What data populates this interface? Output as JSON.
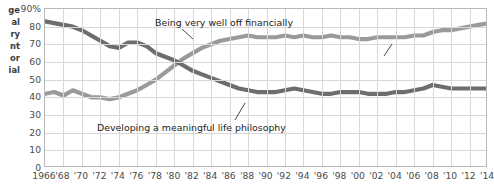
{
  "axis_caption": {
    "text": "ge\nal\nry\nnt\nor\nial",
    "full_lines": [
      "ge",
      "al",
      "ry",
      "nt",
      "or",
      "ial"
    ]
  },
  "colors": {
    "financial_line": "#9a9a9a",
    "philosophy_line": "#6d6d6d",
    "grid": "#d8d8d8",
    "frame": "#b9b9b9",
    "text": "#4a4a4a"
  },
  "annotations": {
    "financial": "Being very well off financially",
    "philosophy": "Developing a meaningful life philosophy"
  },
  "chart_data": {
    "type": "line",
    "title": "",
    "xlabel": "",
    "ylabel": "",
    "ylim": [
      0,
      90
    ],
    "xlim": [
      1966,
      2014
    ],
    "grid": true,
    "legend": "none (inline annotations)",
    "ytick_labels": [
      "90%",
      "80",
      "70",
      "60",
      "50",
      "40",
      "30",
      "20",
      "10",
      "0"
    ],
    "ytick_values": [
      90,
      80,
      70,
      60,
      50,
      40,
      30,
      20,
      10,
      0
    ],
    "xtick_labels": [
      "1966",
      "'68",
      "'70",
      "'72",
      "'74",
      "'76",
      "'78",
      "'80",
      "'82",
      "'84",
      "'86",
      "'88",
      "'90",
      "'92",
      "'94",
      "'96",
      "'98",
      "'00",
      "'02",
      "'04",
      "'06",
      "'08",
      "'10",
      "'12",
      "'14"
    ],
    "x": [
      1966,
      1967,
      1968,
      1969,
      1970,
      1971,
      1972,
      1973,
      1974,
      1975,
      1976,
      1977,
      1978,
      1979,
      1980,
      1981,
      1982,
      1983,
      1984,
      1985,
      1986,
      1987,
      1988,
      1989,
      1990,
      1991,
      1992,
      1993,
      1994,
      1995,
      1996,
      1997,
      1998,
      1999,
      2000,
      2001,
      2002,
      2003,
      2004,
      2005,
      2006,
      2007,
      2008,
      2009,
      2010,
      2011,
      2012,
      2013,
      2014
    ],
    "series": [
      {
        "name": "Being very well off financially",
        "color": "#9a9a9a",
        "values": [
          42,
          43,
          41,
          44,
          42,
          40,
          40,
          39,
          40,
          42,
          44,
          47,
          50,
          54,
          58,
          62,
          65,
          68,
          70,
          72,
          73,
          74,
          75,
          74,
          74,
          74,
          75,
          74,
          75,
          74,
          74,
          75,
          74,
          74,
          73,
          73,
          74,
          74,
          74,
          74,
          75,
          75,
          77,
          78,
          78,
          79,
          80,
          81,
          82
        ]
      },
      {
        "name": "Developing a meaningful life philosophy",
        "color": "#6d6d6d",
        "values": [
          83,
          82,
          81,
          80,
          78,
          75,
          72,
          69,
          68,
          71,
          71,
          69,
          65,
          63,
          61,
          58,
          55,
          53,
          51,
          49,
          47,
          45,
          44,
          43,
          43,
          43,
          44,
          45,
          44,
          43,
          42,
          42,
          43,
          43,
          43,
          42,
          42,
          42,
          43,
          43,
          44,
          45,
          47,
          46,
          45,
          45,
          45,
          45,
          45
        ]
      }
    ]
  }
}
